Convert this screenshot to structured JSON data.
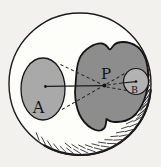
{
  "diagram": {
    "labels": {
      "region_a": "A",
      "point_p": "P",
      "region_b": "B"
    },
    "colors": {
      "paper": "#f2f1ed",
      "sphere_fill": "#fdfdfa",
      "ink": "#1b1b1b",
      "ellipse_a_fill": "#a9a9a9",
      "blob_fill": "#8d8d8d",
      "circle_b_fill": "#b3b3b3"
    }
  }
}
